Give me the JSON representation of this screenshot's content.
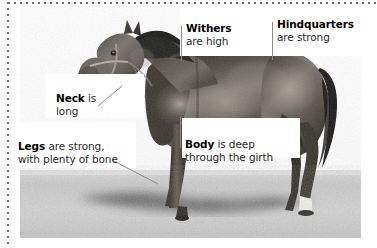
{
  "figure": {
    "accent_line_color": "#8d8d8d",
    "text_color": "#1a1a1a",
    "border_style": "dotted"
  },
  "callouts": [
    {
      "id": "withers",
      "term": "Withers",
      "rest": "are high",
      "line": "vertical"
    },
    {
      "id": "hindquarters",
      "term": "Hindquarters",
      "rest": "are strong",
      "line": "vertical"
    },
    {
      "id": "neck",
      "term": "Neck",
      "rest": "is",
      "rest2": "long",
      "line": "diagonal"
    },
    {
      "id": "legs",
      "term": "Legs",
      "rest": "are strong,",
      "rest2": "with plenty of bone",
      "line": "diagonal"
    },
    {
      "id": "body",
      "term": "Body",
      "rest": "is deep",
      "rest2": "through the girth",
      "line": "vertical"
    }
  ]
}
